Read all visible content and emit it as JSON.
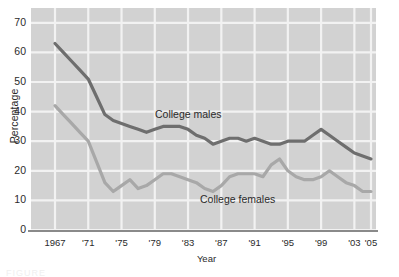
{
  "chart_data": {
    "type": "line",
    "title": "",
    "subtitle": "",
    "xlabel": "Year",
    "ylabel": "Percentage",
    "xlim": [
      1967,
      2005
    ],
    "ylim": [
      0,
      75
    ],
    "grid": true,
    "legend_position": "inline-annotations",
    "y_ticks": [
      "0",
      "10",
      "20",
      "30",
      "40",
      "50",
      "60",
      "70"
    ],
    "y_tick_values": [
      0,
      10,
      20,
      30,
      40,
      50,
      60,
      70
    ],
    "x_ticks": [
      "1967",
      "'71",
      "'75",
      "'79",
      "'83",
      "'87",
      "'91",
      "'95",
      "'99",
      "'03",
      "'05"
    ],
    "x_tick_values": [
      1967,
      1971,
      1975,
      1979,
      1983,
      1987,
      1991,
      1995,
      1999,
      2003,
      2005
    ],
    "x": [
      1967,
      1968,
      1969,
      1970,
      1971,
      1972,
      1973,
      1974,
      1975,
      1976,
      1977,
      1978,
      1979,
      1980,
      1981,
      1982,
      1983,
      1984,
      1985,
      1986,
      1987,
      1988,
      1989,
      1990,
      1991,
      1992,
      1993,
      1994,
      1995,
      1996,
      1997,
      1998,
      1999,
      2000,
      2001,
      2002,
      2003,
      2004,
      2005
    ],
    "series": [
      {
        "name": "College males",
        "color": "#6e6e6e",
        "annotation": "College males",
        "values": [
          63,
          60,
          57,
          54,
          51,
          45,
          39,
          37,
          36,
          35,
          34,
          33,
          34,
          35,
          35,
          35,
          34,
          32,
          31,
          29,
          30,
          31,
          31,
          30,
          31,
          30,
          29,
          29,
          30,
          30,
          30,
          32,
          34,
          32,
          30,
          28,
          26,
          25,
          24
        ]
      },
      {
        "name": "College females",
        "color": "#a8a8a8",
        "annotation": "College females",
        "values": [
          42,
          39,
          36,
          33,
          30,
          23,
          16,
          13,
          15,
          17,
          14,
          15,
          17,
          19,
          19,
          18,
          17,
          16,
          14,
          13,
          15,
          18,
          19,
          19,
          19,
          18,
          22,
          24,
          20,
          18,
          17,
          17,
          18,
          20,
          18,
          16,
          15,
          13,
          13
        ]
      }
    ],
    "annotations": [
      {
        "text": "College males",
        "x": 1980,
        "y": 44
      },
      {
        "text": "College females",
        "x": 1987,
        "y": 8
      }
    ],
    "colors": {
      "plot_background": "#d2d2d2",
      "gridline": "#f2f2f2",
      "axis": "#8a8a8a",
      "text": "#2b2b2b",
      "series_males": "#6e6e6e",
      "series_females": "#a8a8a8",
      "page_background": "#ffffff"
    }
  },
  "caption": {
    "text": "FIGURE"
  }
}
